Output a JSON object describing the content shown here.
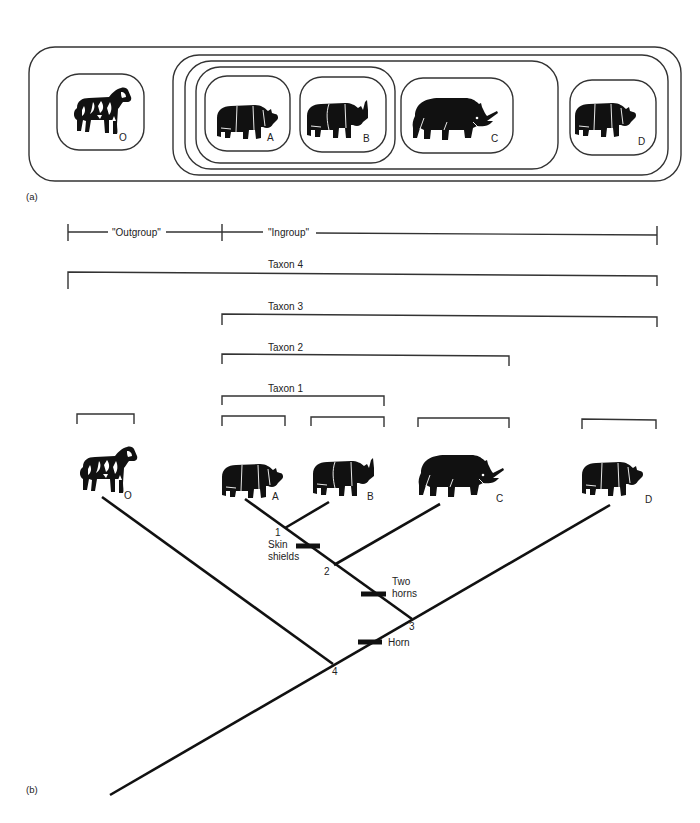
{
  "figure": {
    "panel_a_label": "(a)",
    "panel_b_label": "(b)"
  },
  "panel_a": {
    "taxa": [
      {
        "id": "O",
        "label": "O",
        "animal": "zebra-icon"
      },
      {
        "id": "A",
        "label": "A",
        "animal": "rhino-icon"
      },
      {
        "id": "B",
        "label": "B",
        "animal": "rhino-icon"
      },
      {
        "id": "C",
        "label": "C",
        "animal": "rhino-icon"
      },
      {
        "id": "D",
        "label": "D",
        "animal": "rhino-icon"
      }
    ],
    "nested_groups": [
      {
        "name": "Taxon 1",
        "members": [
          "A",
          "B"
        ]
      },
      {
        "name": "Taxon 2",
        "members": [
          "A",
          "B",
          "C"
        ]
      },
      {
        "name": "Taxon 3",
        "members": [
          "A",
          "B",
          "C",
          "D"
        ]
      },
      {
        "name": "Taxon 4",
        "members": [
          "O",
          "A",
          "B",
          "C",
          "D"
        ]
      }
    ]
  },
  "panel_b": {
    "group_bars": {
      "outgroup": "\"Outgroup\"",
      "ingroup": "\"Ingroup\""
    },
    "taxon_brackets": {
      "taxon4": "Taxon 4",
      "taxon3": "Taxon 3",
      "taxon2": "Taxon 2",
      "taxon1": "Taxon 1"
    },
    "tips": [
      {
        "id": "O",
        "label": "O"
      },
      {
        "id": "A",
        "label": "A"
      },
      {
        "id": "B",
        "label": "B"
      },
      {
        "id": "C",
        "label": "C"
      },
      {
        "id": "D",
        "label": "D"
      }
    ],
    "nodes": [
      {
        "id": "1",
        "label": "1"
      },
      {
        "id": "2",
        "label": "2"
      },
      {
        "id": "3",
        "label": "3"
      },
      {
        "id": "4",
        "label": "4"
      }
    ],
    "characters": [
      {
        "line1": "Skin",
        "line2": "shields",
        "on_branch": "node2-to-node1"
      },
      {
        "line1": "Two",
        "line2": "horns",
        "on_branch": "node3-to-node2"
      },
      {
        "line1": "Horn",
        "line2": "",
        "on_branch": "node4-to-node3"
      }
    ]
  }
}
